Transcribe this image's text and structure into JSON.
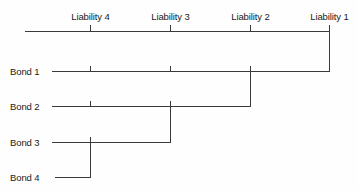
{
  "diagram": {
    "type": "timeline-staircase",
    "colors": {
      "line": "#3a3a3a",
      "text": "#1b1b1b",
      "background": "#fefefe"
    },
    "axis": {
      "name": "liability-timeline",
      "x_start": 25,
      "x_end": 330,
      "y": 31,
      "tick_height": 6,
      "tick_direction": "up",
      "ticks": [
        {
          "label": "Liability 4",
          "x": 90
        },
        {
          "label": "Liability 3",
          "x": 170
        },
        {
          "label": "Liability 2",
          "x": 250
        },
        {
          "label": "Liability 1",
          "x": 330
        }
      ]
    },
    "bonds": [
      {
        "label": "Bond 1",
        "label_x": 10,
        "label_y": 66,
        "line_y": 71,
        "line_x_start": 52,
        "line_x_end": 330,
        "matures_at": "Liability 1",
        "riser_x": 330,
        "riser_from_y": 31,
        "ticks_x": [
          90,
          170,
          250
        ]
      },
      {
        "label": "Bond 2",
        "label_x": 10,
        "label_y": 101,
        "line_y": 106,
        "line_x_start": 52,
        "line_x_end": 250,
        "matures_at": "Liability 2",
        "riser_x": 250,
        "riser_from_y": 71,
        "ticks_x": [
          90,
          170
        ]
      },
      {
        "label": "Bond 3",
        "label_x": 10,
        "label_y": 137,
        "line_y": 142,
        "line_x_start": 52,
        "line_x_end": 170,
        "matures_at": "Liability 3",
        "riser_x": 170,
        "riser_from_y": 106,
        "ticks_x": [
          90
        ]
      },
      {
        "label": "Bond 4",
        "label_x": 10,
        "label_y": 172,
        "line_y": 177,
        "line_x_start": 55,
        "line_x_end": 90,
        "matures_at": "Liability 4",
        "riser_x": 90,
        "riser_from_y": 142,
        "ticks_x": []
      }
    ]
  }
}
